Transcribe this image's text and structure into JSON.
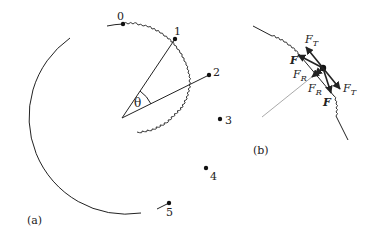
{
  "figure": {
    "panel_a": {
      "label": "(a)",
      "angle_label": "θ",
      "points": [
        {
          "label": "0"
        },
        {
          "label": "1"
        },
        {
          "label": "2"
        },
        {
          "label": "3"
        },
        {
          "label": "4"
        },
        {
          "label": "5"
        }
      ]
    },
    "panel_b": {
      "label": "(b)",
      "forces": {
        "ft_upper": {
          "main": "F",
          "sub": "T"
        },
        "f_upper": "F",
        "fr_left": {
          "main": "F",
          "sub": "R"
        },
        "fr_lower": {
          "main": "F",
          "sub": "R"
        },
        "ft_lower": {
          "main": "F",
          "sub": "T"
        },
        "f_lower": "F"
      }
    },
    "colors": {
      "stroke": "#222222",
      "radial_line_b": "#aaaaaa"
    }
  }
}
